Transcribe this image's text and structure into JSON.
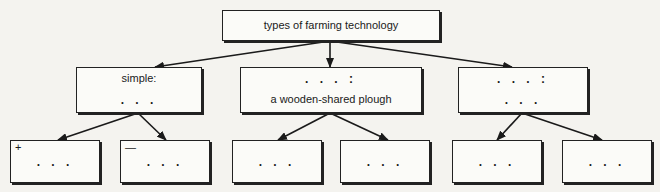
{
  "diagram": {
    "root": {
      "label": "types of farming technology"
    },
    "level2": [
      {
        "line1": "simple:",
        "line2": ". . ."
      },
      {
        "line1": ". . . :",
        "line2": "a wooden-shared plough"
      },
      {
        "line1": ". . . :",
        "line2": ". . ."
      }
    ],
    "level3": [
      {
        "corner": "+",
        "label": ". . ."
      },
      {
        "corner": "—",
        "label": ". . ."
      },
      {
        "corner": "",
        "label": ". . ."
      },
      {
        "corner": "",
        "label": ". . ."
      },
      {
        "corner": "",
        "label": ". . ."
      },
      {
        "corner": "",
        "label": ". . ."
      }
    ],
    "colors": {
      "line": "#1a1a1a",
      "background": "#f4f3ef",
      "box_fill": "#fbfbf8"
    }
  }
}
